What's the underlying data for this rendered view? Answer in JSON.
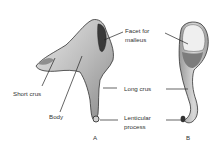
{
  "diagram": {
    "labels": {
      "facet": "Facet for\nmalleus",
      "facet_l1": "Facet for",
      "facet_l2": "malleus",
      "short_crus": "Short crus",
      "body": "Body",
      "long_crus": "Long crus",
      "lenticular_l1": "Lenticular",
      "lenticular_l2": "process"
    },
    "views": {
      "a": "A",
      "b": "B"
    }
  }
}
